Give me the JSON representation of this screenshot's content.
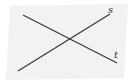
{
  "diagram": {
    "type": "geometry",
    "plane": {
      "fill": "#f2f2f2",
      "points": "10,6 128,4 124,78 6,80"
    },
    "lines": [
      {
        "label": "s",
        "x1": 18,
        "y1": 71,
        "x2": 110,
        "y2": 14,
        "label_x": 108,
        "label_y": 13
      },
      {
        "label": "t",
        "x1": 23,
        "y1": 15,
        "x2": 117,
        "y2": 63,
        "label_x": 114,
        "label_y": 58
      }
    ],
    "line_color": "#3a3a3a"
  }
}
